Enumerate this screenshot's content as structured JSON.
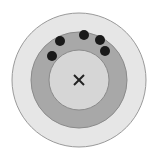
{
  "diagram": {
    "center": [
      79,
      80
    ],
    "rings": [
      {
        "name": "outer-ring",
        "r": 67,
        "fill": "#e6e6e6",
        "stroke": "#9a9a9a"
      },
      {
        "name": "middle-ring",
        "r": 48,
        "fill": "#a8a8a8",
        "stroke": "#8a8a8a"
      },
      {
        "name": "inner-circle",
        "r": 30,
        "fill": "#d6d6d6",
        "stroke": "#8a8a8a"
      }
    ],
    "center_marker": {
      "symbol": "x-mark",
      "color": "#222222"
    },
    "dots": [
      {
        "cx": 60,
        "cy": 41
      },
      {
        "cx": 84,
        "cy": 35
      },
      {
        "cx": 100,
        "cy": 40
      },
      {
        "cx": 105,
        "cy": 51
      },
      {
        "cx": 52,
        "cy": 56
      }
    ],
    "dot_color": "#1a1a1a",
    "dot_radius": 5
  }
}
